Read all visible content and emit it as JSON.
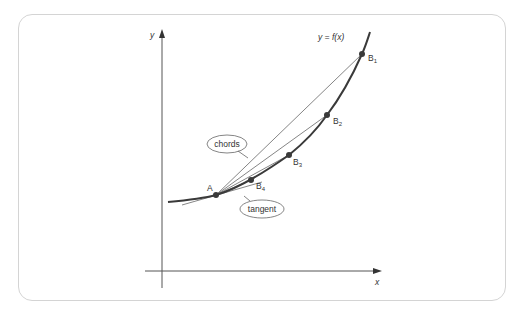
{
  "figure": {
    "type": "tangent-limit-diagram",
    "axes": {
      "x_label": "x",
      "y_label": "y"
    },
    "curve_label": "y = f(x)",
    "points": [
      {
        "name": "A",
        "label": "A",
        "sub": ""
      },
      {
        "name": "B1",
        "label": "B",
        "sub": "1"
      },
      {
        "name": "B2",
        "label": "B",
        "sub": "2"
      },
      {
        "name": "B3",
        "label": "B",
        "sub": "3"
      },
      {
        "name": "B4",
        "label": "B",
        "sub": "4"
      }
    ],
    "callouts": {
      "chords": "chords",
      "tangent": "tangent"
    },
    "colors": {
      "curve": "#3a3a3a",
      "lines": "#555555",
      "frame": "#d4d4d4",
      "points": "#3a3a3a"
    }
  }
}
